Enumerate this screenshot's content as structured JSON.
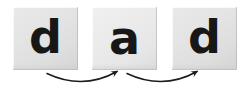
{
  "canvas": {
    "width": 249,
    "height": 93,
    "background_color": "#ffffff"
  },
  "diagram": {
    "kind": "letter-sequence-blending",
    "word": "dad",
    "tile_count": 3,
    "arrow_count": 2,
    "tile_fill_color": "#e6e6e6",
    "letter_color": "#171717",
    "arrow_color": "#1c1c1c"
  },
  "tiles": [
    {
      "id": "tile-1",
      "letter": "d",
      "x": 13,
      "y": 7,
      "w": 65,
      "h": 63
    },
    {
      "id": "tile-2",
      "letter": "a",
      "x": 92,
      "y": 7,
      "w": 65,
      "h": 63
    },
    {
      "id": "tile-3",
      "letter": "d",
      "x": 172,
      "y": 7,
      "w": 65,
      "h": 63
    }
  ],
  "arrows": [
    {
      "id": "arrow-1",
      "from_tile": "tile-1",
      "to_tile": "tile-2",
      "direction": "left-to-right",
      "shape": "curve-downward",
      "start_x": 47,
      "start_y": 74,
      "end_x": 118,
      "end_y": 71
    },
    {
      "id": "arrow-2",
      "from_tile": "tile-2",
      "to_tile": "tile-3",
      "direction": "left-to-right",
      "shape": "curve-downward",
      "start_x": 127,
      "start_y": 74,
      "end_x": 198,
      "end_y": 71
    }
  ]
}
